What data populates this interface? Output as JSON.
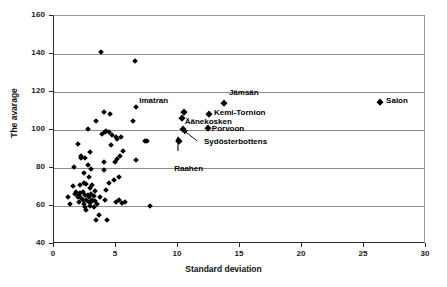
{
  "chart_data": {
    "type": "scatter",
    "title": "",
    "xlabel": "Standard deviation",
    "ylabel": "The avarage",
    "xlim": [
      0,
      30
    ],
    "ylim": [
      40,
      160
    ],
    "xticks": [
      0,
      5,
      10,
      15,
      20,
      25,
      30
    ],
    "yticks": [
      40,
      60,
      80,
      100,
      120,
      140,
      160
    ],
    "grid": "horizontal",
    "legend": "none",
    "marker": "diamond",
    "marker_color": "#000000",
    "annotations": [
      {
        "label": "Imatran",
        "x": 10.5,
        "y": 109.7
      },
      {
        "label": "Jämsän",
        "x": 13.7,
        "y": 114.0
      },
      {
        "label": "Kemi-Tornion",
        "x": 12.5,
        "y": 108.5
      },
      {
        "label": "Äänekosken",
        "x": 10.3,
        "y": 106.2
      },
      {
        "label": "Porvoon",
        "x": 12.4,
        "y": 101.0
      },
      {
        "label": "Sydösterbottens",
        "x": 10.4,
        "y": 100.6
      },
      {
        "label": "Raahen",
        "x": 10.1,
        "y": 94.2
      },
      {
        "label": "Salon",
        "x": 26.3,
        "y": 114.8
      }
    ],
    "points": [
      [
        1.1,
        64.8
      ],
      [
        1.3,
        61.2
      ],
      [
        1.5,
        70.8
      ],
      [
        1.6,
        80.6
      ],
      [
        1.7,
        66.3
      ],
      [
        1.8,
        67.5
      ],
      [
        1.9,
        64.9
      ],
      [
        1.9,
        92.9
      ],
      [
        2.0,
        65.8
      ],
      [
        2.0,
        62.3
      ],
      [
        2.1,
        66.9
      ],
      [
        2.1,
        70.9
      ],
      [
        2.2,
        64.4
      ],
      [
        2.2,
        85.3
      ],
      [
        2.2,
        86.2
      ],
      [
        2.3,
        63.2
      ],
      [
        2.3,
        67.2
      ],
      [
        2.4,
        61.0
      ],
      [
        2.4,
        72.1
      ],
      [
        2.4,
        77.2
      ],
      [
        2.5,
        65.9
      ],
      [
        2.5,
        59.7
      ],
      [
        2.5,
        85.2
      ],
      [
        2.6,
        63.4
      ],
      [
        2.6,
        71.5
      ],
      [
        2.6,
        57.7
      ],
      [
        2.7,
        66.0
      ],
      [
        2.7,
        81.5
      ],
      [
        2.7,
        100.4
      ],
      [
        2.8,
        62.0
      ],
      [
        2.8,
        64.8
      ],
      [
        2.8,
        75.2
      ],
      [
        2.9,
        60.2
      ],
      [
        2.9,
        69.7
      ],
      [
        2.9,
        88.2
      ],
      [
        3.0,
        61.9
      ],
      [
        3.0,
        66.6
      ],
      [
        3.0,
        79.6
      ],
      [
        3.1,
        63.2
      ],
      [
        3.1,
        71.1
      ],
      [
        3.2,
        59.5
      ],
      [
        3.2,
        65.2
      ],
      [
        3.3,
        62.6
      ],
      [
        3.3,
        67.9
      ],
      [
        3.4,
        52.6
      ],
      [
        3.4,
        104.6
      ],
      [
        3.5,
        60.9
      ],
      [
        3.6,
        55.2
      ],
      [
        3.7,
        64.8
      ],
      [
        3.8,
        141.0
      ],
      [
        3.9,
        98.1
      ],
      [
        4.0,
        109.6
      ],
      [
        4.0,
        79.2
      ],
      [
        4.0,
        83.4
      ],
      [
        4.1,
        98.8
      ],
      [
        4.1,
        63.2
      ],
      [
        4.2,
        99.3
      ],
      [
        4.2,
        68.4
      ],
      [
        4.3,
        52.4
      ],
      [
        4.4,
        99.2
      ],
      [
        4.4,
        72.0
      ],
      [
        4.5,
        108.4
      ],
      [
        4.6,
        92.3
      ],
      [
        4.7,
        97.3
      ],
      [
        4.8,
        73.7
      ],
      [
        4.9,
        83.3
      ],
      [
        5.0,
        96.4
      ],
      [
        5.0,
        61.9
      ],
      [
        5.1,
        95.5
      ],
      [
        5.1,
        84.6
      ],
      [
        5.2,
        75.2
      ],
      [
        5.2,
        63.4
      ],
      [
        5.3,
        86.2
      ],
      [
        5.4,
        96.2
      ],
      [
        5.5,
        61.7
      ],
      [
        5.6,
        88.9
      ],
      [
        5.7,
        62.0
      ],
      [
        6.4,
        104.7
      ],
      [
        6.5,
        136.2
      ],
      [
        6.6,
        112.3
      ],
      [
        6.6,
        84.3
      ],
      [
        7.3,
        94.0
      ],
      [
        7.5,
        94.5
      ],
      [
        7.7,
        59.9
      ]
    ]
  }
}
